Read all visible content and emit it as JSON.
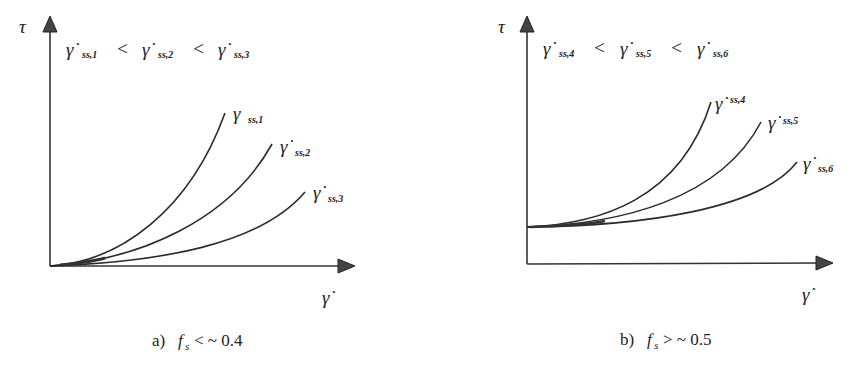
{
  "figure": {
    "panels": [
      {
        "id": "a",
        "y_axis_label": "τ",
        "x_axis_label": "γ̇",
        "ordering": {
          "terms": [
            {
              "symbol": "γ̇",
              "subscript": "ss,1"
            },
            {
              "symbol": "γ̇",
              "subscript": "ss,2"
            },
            {
              "symbol": "γ̇",
              "subscript": "ss,3"
            }
          ],
          "operator": "<"
        },
        "curves": [
          {
            "symbol": "γ",
            "subscript": "ss,1"
          },
          {
            "symbol": "γ̇",
            "subscript": "ss,2"
          },
          {
            "symbol": "γ̇",
            "subscript": "ss,3"
          }
        ],
        "caption": {
          "prefix": "a)",
          "var": "f",
          "var_sub": "s",
          "condition": "< ~ 0.4"
        }
      },
      {
        "id": "b",
        "y_axis_label": "τ",
        "x_axis_label": "γ̇",
        "ordering": {
          "terms": [
            {
              "symbol": "γ̇",
              "subscript": "ss,4"
            },
            {
              "symbol": "γ̇",
              "subscript": "ss,5"
            },
            {
              "symbol": "γ̇",
              "subscript": "ss,6"
            }
          ],
          "operator": "<"
        },
        "curves": [
          {
            "symbol": "γ̇",
            "subscript": "ss,4"
          },
          {
            "symbol": "γ̇",
            "subscript": "ss,5"
          },
          {
            "symbol": "γ̇",
            "subscript": "ss,6"
          }
        ],
        "caption": {
          "prefix": "b)",
          "var": "f",
          "var_sub": "s",
          "condition": "> ~ 0.5"
        }
      }
    ],
    "colors": {
      "ink": "#222222",
      "background": "#ffffff"
    }
  }
}
